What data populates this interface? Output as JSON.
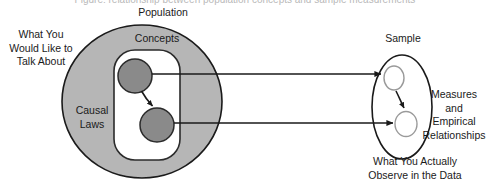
{
  "figure": {
    "truncated_title": "Figure: relationship between population concepts and sample measurements",
    "left_model": {
      "outer_label": "Population",
      "inner_label": "Concepts",
      "region_label": "Causal\nLaws",
      "side_caption": "What You\nWould Like to\nTalk About",
      "nodes": [
        {
          "id": "concept-node-1",
          "fill": "#8a8a8a",
          "stroke": "#2b2b2b"
        },
        {
          "id": "concept-node-2",
          "fill": "#8a8a8a",
          "stroke": "#2b2b2b"
        }
      ],
      "internal_arrow": "causal-link"
    },
    "right_model": {
      "outer_label": "Sample",
      "side_caption": "Measures\nand\nEmpirical\nRelationships",
      "bottom_caption": "What You Actually\nObserve in the Data",
      "nodes": [
        {
          "id": "measure-node-1",
          "fill": "#ffffff",
          "stroke": "#9a9a9a"
        },
        {
          "id": "measure-node-2",
          "fill": "#ffffff",
          "stroke": "#9a9a9a"
        }
      ],
      "internal_arrow": "empirical-link"
    },
    "mapping_arrows": [
      {
        "id": "mapping-arrow-top",
        "from": "concept-node-1",
        "to": "measure-node-1"
      },
      {
        "id": "mapping-arrow-bottom",
        "from": "concept-node-2",
        "to": "measure-node-2"
      }
    ],
    "colors": {
      "population_fill": "#b6b6b6",
      "population_stroke": "#1a1a1a",
      "concepts_fill": "#ffffff",
      "concepts_stroke": "#2b2b2b",
      "node_fill": "#8a8a8a",
      "sample_stroke": "#1a1a1a",
      "sample_node_stroke": "#9a9a9a",
      "arrow": "#1a1a1a",
      "background": "#ffffff"
    }
  }
}
